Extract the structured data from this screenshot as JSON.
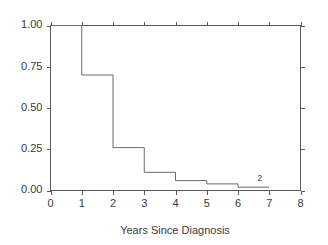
{
  "chart_data": {
    "type": "line",
    "subtype": "step-kaplan-meier",
    "title": "",
    "xlabel": "Years Since Diagnosis",
    "ylabel": "",
    "xlim": [
      0,
      8
    ],
    "ylim": [
      0.0,
      1.0
    ],
    "xticks": [
      0,
      1,
      2,
      3,
      4,
      5,
      6,
      7,
      8
    ],
    "xtick_labels": [
      "0",
      "1",
      "2",
      "3",
      "4",
      "5",
      "6",
      "7",
      "8"
    ],
    "yticks": [
      0.0,
      0.25,
      0.5,
      0.75,
      1.0
    ],
    "ytick_labels": [
      "0.00",
      "0.25",
      "0.50",
      "0.75",
      "1.00"
    ],
    "grid": false,
    "legend": null,
    "series": [
      {
        "name": "survival",
        "step": "post",
        "x": [
          0,
          1,
          2,
          3,
          4,
          5,
          6,
          7
        ],
        "y": [
          1.0,
          0.7,
          0.26,
          0.11,
          0.06,
          0.04,
          0.02,
          0.02
        ],
        "color": "#6b6b6b"
      }
    ],
    "annotations": [
      {
        "text": "2",
        "x": 6.7,
        "y": 0.055
      }
    ],
    "box_spines": [
      "left",
      "right",
      "top",
      "bottom"
    ],
    "tick_direction": "out"
  },
  "axes": {
    "x_title": "Years Since Diagnosis"
  },
  "colors": {
    "curve": "#6b6b6b",
    "spine": "#5a5a5a",
    "text": "#3a3a3a",
    "background": "#ffffff"
  }
}
